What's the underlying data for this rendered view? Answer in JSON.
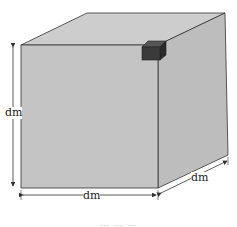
{
  "diagram": {
    "type": "cube-with-unit-cube",
    "labels": {
      "height": "dm",
      "width": "dm",
      "depth": "dm"
    },
    "colors": {
      "cube_face": "#c4c4c4",
      "cube_top": "#cdcdcd",
      "cube_side": "#bdbdbd",
      "edge": "#333333",
      "small_cube_front": "#3a3a3a",
      "small_cube_top": "#555555",
      "small_cube_side": "#2a2a2a"
    },
    "caption": "… … …"
  }
}
